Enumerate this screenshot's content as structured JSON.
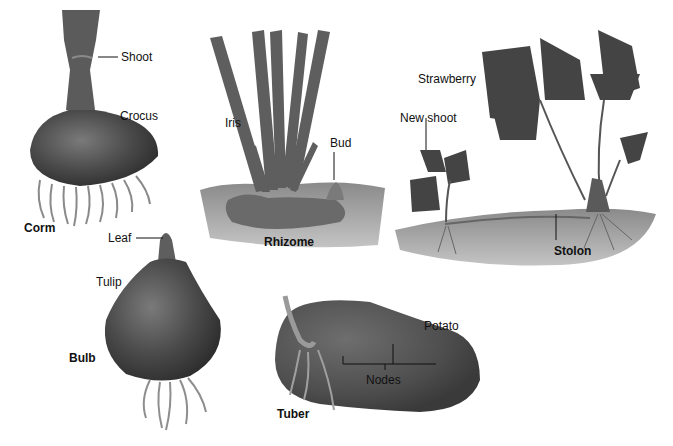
{
  "figure": {
    "panels": [
      {
        "id": "corm",
        "plant": "Crocus",
        "structure": "Corm",
        "parts": [
          "Shoot"
        ]
      },
      {
        "id": "rhizome",
        "plant": "Iris",
        "structure": "Rhizome",
        "parts": [
          "Bud"
        ]
      },
      {
        "id": "stolon",
        "plant": "Strawberry",
        "structure": "Stolon",
        "parts": [
          "New shoot"
        ]
      },
      {
        "id": "bulb",
        "plant": "Tulip",
        "structure": "Bulb",
        "parts": [
          "Leaf"
        ]
      },
      {
        "id": "tuber",
        "plant": "Potato",
        "structure": "Tuber",
        "parts": [
          "Nodes"
        ]
      }
    ]
  },
  "labels": {
    "shoot": "Shoot",
    "crocus": "Crocus",
    "corm": "Corm",
    "iris": "Iris",
    "bud": "Bud",
    "rhizome": "Rhizome",
    "strawberry": "Strawberry",
    "new_shoot": "New shoot",
    "stolon": "Stolon",
    "leaf": "Leaf",
    "tulip": "Tulip",
    "bulb": "Bulb",
    "potato": "Potato",
    "nodes": "Nodes",
    "tuber": "Tuber"
  },
  "colors": {
    "plant_dark": "#3f3f3f",
    "plant_mid": "#5a5a5a",
    "root": "#8a8a8a",
    "soil": "#9a9a9a",
    "leader": "#111111"
  }
}
